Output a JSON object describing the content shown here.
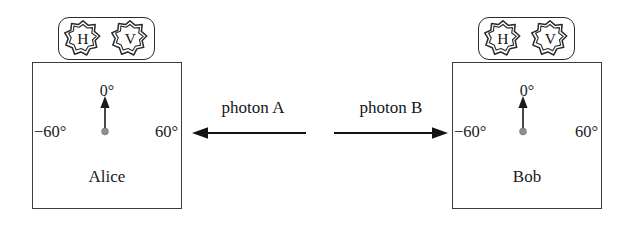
{
  "figure": {
    "background_color": "#ffffff",
    "line_color": "#2b2b2b"
  },
  "stations": [
    {
      "id": "alice",
      "name_label": "Alice",
      "badge": {
        "outputs": [
          {
            "icon": "octagram-badge-icon",
            "letter": "H"
          },
          {
            "icon": "octagram-badge-icon",
            "letter": "V"
          }
        ]
      },
      "dial": {
        "top_angle": "0°",
        "left_angle": "−60°",
        "right_angle": "60°",
        "pointer_direction": "up",
        "pivot_color": "#8c8c8c"
      }
    },
    {
      "id": "bob",
      "name_label": "Bob",
      "badge": {
        "outputs": [
          {
            "icon": "octagram-badge-icon",
            "letter": "H"
          },
          {
            "icon": "octagram-badge-icon",
            "letter": "V"
          }
        ]
      },
      "dial": {
        "top_angle": "0°",
        "left_angle": "−60°",
        "right_angle": "60°",
        "pointer_direction": "up",
        "pivot_color": "#8c8c8c"
      }
    }
  ],
  "photons": [
    {
      "id": "photon-a",
      "label": "photon A",
      "direction": "left"
    },
    {
      "id": "photon-b",
      "label": "photon B",
      "direction": "right"
    }
  ]
}
